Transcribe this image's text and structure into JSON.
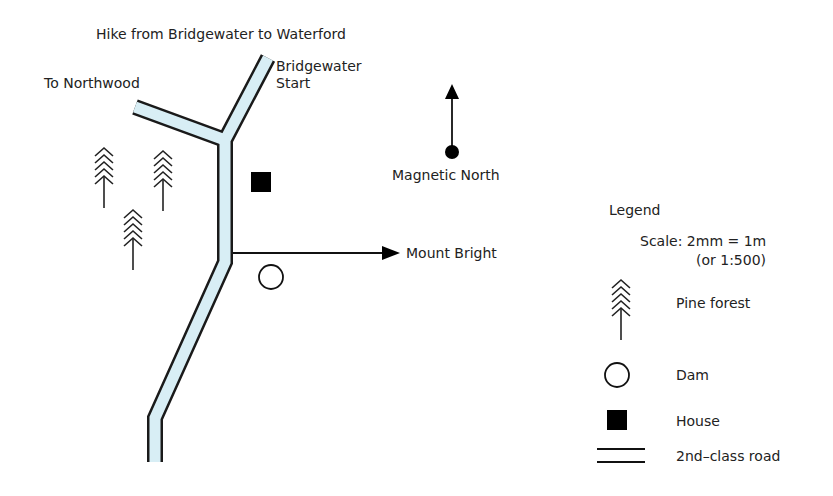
{
  "title": "Hike from Bridgewater to Waterford",
  "map": {
    "labels": {
      "to_northwood": "To Northwood",
      "bridgewater_start_line1": "Bridgewater",
      "bridgewater_start_line2": "Start",
      "magnetic_north": "Magnetic North",
      "mount_bright": "Mount Bright"
    },
    "features": [
      {
        "type": "pine-forest",
        "count": 3
      },
      {
        "type": "house",
        "count": 1
      },
      {
        "type": "dam",
        "count": 1
      },
      {
        "type": "2nd-class-road",
        "count": 1
      }
    ],
    "colors": {
      "road_fill": "#d8eef5",
      "road_edge": "#1a1a1a",
      "ink": "#111111"
    }
  },
  "legend": {
    "title": "Legend",
    "scale_line1": "Scale: 2mm = 1m",
    "scale_line2": "(or 1:500)",
    "items": [
      {
        "icon": "pine-forest-icon",
        "label": "Pine forest"
      },
      {
        "icon": "dam-icon",
        "label": "Dam"
      },
      {
        "icon": "house-icon",
        "label": "House"
      },
      {
        "icon": "road-icon",
        "label": "2nd–class road"
      }
    ]
  }
}
